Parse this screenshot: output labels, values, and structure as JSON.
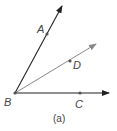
{
  "diagram": {
    "vertex": {
      "label": "B",
      "x": 15,
      "y": 93
    },
    "rays": [
      {
        "name": "BA",
        "point": {
          "label": "A",
          "x": 47,
          "y": 34
        },
        "tip": {
          "x": 62,
          "y": 6
        },
        "color": "#222222"
      },
      {
        "name": "BD",
        "point": {
          "label": "D",
          "x": 70,
          "y": 61
        },
        "tip": {
          "x": 96,
          "y": 44
        },
        "color": "#888888"
      },
      {
        "name": "BC",
        "point": {
          "label": "C",
          "x": 80,
          "y": 93
        },
        "tip": {
          "x": 109,
          "y": 93
        },
        "color": "#222222"
      }
    ],
    "caption": "(a)"
  }
}
